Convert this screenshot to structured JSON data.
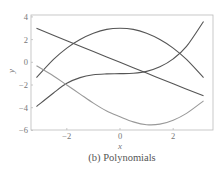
{
  "caption": "(b) Polynomials",
  "chart_data": {
    "type": "line",
    "title": "",
    "caption": "(b) Polynomials",
    "xlabel": "x",
    "ylabel": "y",
    "xlim": [
      -3.5,
      3.5
    ],
    "ylim": [
      -6,
      4
    ],
    "xticks": [
      -2,
      0,
      2
    ],
    "yticks": [
      4,
      2,
      0,
      -2,
      -4,
      -6
    ],
    "xtick_labels": [
      "−2",
      "0",
      "2"
    ],
    "ytick_labels": [
      "4",
      "2",
      "0",
      "−2",
      "−4",
      "−6"
    ],
    "grid": false,
    "legend": null,
    "series": [
      {
        "name": "linear",
        "color": "#555555",
        "x": [
          -3.14,
          -2,
          -1,
          0,
          1,
          2,
          3.14
        ],
        "y": [
          3.0,
          1.9,
          0.95,
          0.0,
          -0.95,
          -1.9,
          -2.95
        ]
      },
      {
        "name": "quadratic (concave)",
        "color": "#555555",
        "x": [
          -3.14,
          -2.5,
          -2,
          -1.5,
          -1,
          -0.5,
          0,
          0.5,
          1,
          1.5,
          2,
          2.5,
          3.14
        ],
        "y": [
          -1.35,
          0.25,
          1.25,
          2.0,
          2.55,
          2.9,
          3.0,
          2.9,
          2.55,
          2.0,
          1.25,
          0.25,
          -1.35
        ]
      },
      {
        "name": "cubic",
        "color": "#555555",
        "x": [
          -3.14,
          -2.5,
          -2,
          -1.5,
          -1,
          -0.5,
          0,
          0.5,
          1,
          1.5,
          2,
          2.5,
          3.14
        ],
        "y": [
          -3.9,
          -2.7,
          -1.85,
          -1.35,
          -1.1,
          -1.02,
          -1.0,
          -0.96,
          -0.8,
          -0.4,
          0.3,
          1.4,
          3.6
        ]
      },
      {
        "name": "quadratic (convex)",
        "color": "#999999",
        "x": [
          -3.14,
          -2.5,
          -2,
          -1.5,
          -1,
          -0.5,
          0,
          0.5,
          1,
          1.5,
          2,
          2.5,
          3.14
        ],
        "y": [
          -0.3,
          -1.2,
          -2.0,
          -2.8,
          -3.6,
          -4.3,
          -4.8,
          -5.25,
          -5.5,
          -5.45,
          -5.1,
          -4.5,
          -3.4
        ]
      }
    ]
  }
}
